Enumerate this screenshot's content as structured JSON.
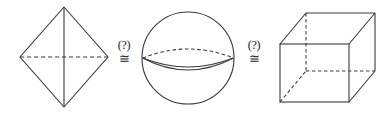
{
  "figure": {
    "background_color": "#fefefe",
    "stroke_color": "#3a3a3a",
    "width": 376,
    "height": 119,
    "shapes": [
      {
        "name": "octahedron",
        "label": "octahedron",
        "description": "Diamond outline with solid vertical axis and dashed horizontal axis",
        "center_x": 64,
        "center_y": 57,
        "half_width": 44,
        "half_height": 50
      },
      {
        "name": "sphere",
        "label": "sphere",
        "description": "Circle with dashed rear equator arc and solid front equator arc",
        "center_x": 188,
        "center_y": 58,
        "radius": 46
      },
      {
        "name": "cube",
        "label": "cube",
        "description": "Wireframe cube in oblique perspective with dashed hidden edges",
        "front_left": 280,
        "front_top": 44,
        "front_right": 349,
        "front_bottom": 102,
        "depth_x": 26,
        "depth_y": 31
      }
    ],
    "relations": [
      {
        "name": "relation-1",
        "query": "(?)",
        "sign": "≅",
        "sign_label": "congruent-to",
        "left_shape": "octahedron",
        "right_shape": "sphere",
        "x": 124,
        "y": 52
      },
      {
        "name": "relation-2",
        "query": "(?)",
        "sign": "≅",
        "sign_label": "congruent-to",
        "left_shape": "sphere",
        "right_shape": "cube",
        "x": 254,
        "y": 52
      }
    ]
  }
}
